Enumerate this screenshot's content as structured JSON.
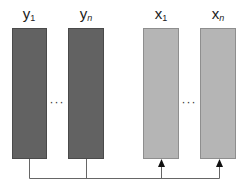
{
  "diagram": {
    "left_group": {
      "first_label": {
        "base": "y",
        "sub": "1"
      },
      "last_label": {
        "base": "y",
        "sub": "n"
      },
      "ellipsis": "···",
      "color": "#626262"
    },
    "right_group": {
      "first_label": {
        "base": "x",
        "sub": "1"
      },
      "last_label": {
        "base": "x",
        "sub": "n"
      },
      "ellipsis": "···",
      "color": "#b5b5b5"
    },
    "connector": {
      "description": "lines from bottoms of y boxes join a horizontal bus that feeds arrows into bottoms of x boxes",
      "line_color": "#555555"
    }
  }
}
